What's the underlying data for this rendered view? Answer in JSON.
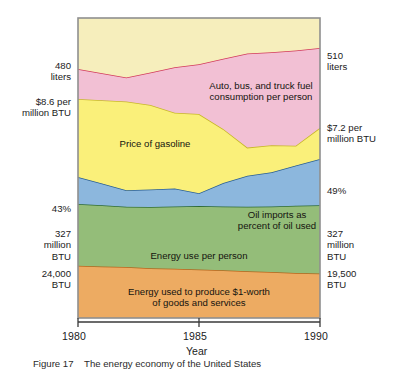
{
  "figure": {
    "caption": "Figure 17    The energy economy of the United States"
  },
  "chart_data": {
    "type": "area",
    "title": "",
    "xlabel": "Year",
    "ylabel": "",
    "xlim": [
      1980,
      1990
    ],
    "ylim": [
      0,
      100
    ],
    "grid": false,
    "legend_position": "inside-bands",
    "x_ticks": [
      "1980",
      "1985",
      "1990"
    ],
    "x": [
      1980,
      1981,
      1982,
      1983,
      1984,
      1985,
      1986,
      1987,
      1988,
      1989,
      1990
    ],
    "stacked_from_bottom": true,
    "series": [
      {
        "name": "Energy used to produce $1-worth of goods and services",
        "label": "Energy used to produce $1-worth\nof goods and services",
        "color": "#edab62",
        "line_color": "#b4651c",
        "units": "BTU",
        "start_value": "24,000 BTU",
        "end_value": "19,500 BTU",
        "band_top_percent": [
          17.4,
          17.2,
          17.0,
          16.6,
          16.4,
          16.2,
          15.9,
          15.6,
          15.3,
          15.0,
          14.8
        ]
      },
      {
        "name": "Energy use per person",
        "label": "Energy use per person",
        "color": "#94bd79",
        "line_color": "#2f6b33",
        "units": "million BTU",
        "start_value": "327 million BTU",
        "end_value": "327 million BTU",
        "band_top_percent": [
          38.0,
          37.6,
          37.1,
          37.0,
          37.2,
          37.3,
          37.2,
          37.1,
          37.2,
          37.4,
          37.6
        ]
      },
      {
        "name": "Oil imports as percent of oil used",
        "label": "Oil imports as\npercent of oil used",
        "color": "#8cb7dd",
        "line_color": "#2a5f93",
        "units": "percent",
        "start_value": "43%",
        "end_value": "49%",
        "band_top_percent": [
          47.0,
          44.8,
          42.6,
          42.8,
          43.2,
          41.6,
          45.0,
          47.4,
          48.6,
          50.8,
          53.0
        ]
      },
      {
        "name": "Price of gasoline",
        "label": "Price of gasoline",
        "color": "#faf07a",
        "line_color": "#c8b82a",
        "units": "per million BTU",
        "start_value": "$8.6 per million BTU",
        "end_value": "$7.2 per million BTU",
        "band_top_percent": [
          73.0,
          72.6,
          72.2,
          71.0,
          68.4,
          68.0,
          63.0,
          56.8,
          57.6,
          57.4,
          63.4
        ]
      },
      {
        "name": "Auto, bus, and truck fuel consumption per person",
        "label": "Auto, bus, and truck fuel\nconsumption per person",
        "color": "#f2c0d4",
        "line_color": "#d23a5c",
        "units": "liters",
        "start_value": "480 liters",
        "end_value": "510 liters",
        "band_top_percent": [
          83.0,
          81.6,
          80.2,
          81.8,
          83.6,
          84.6,
          86.4,
          88.2,
          88.6,
          89.2,
          90.0
        ]
      },
      {
        "name": "Upper background area",
        "label": "",
        "color": "#f6eebc",
        "line_color": "#b9b9b9",
        "units": "",
        "start_value": "",
        "end_value": "",
        "band_top_percent": [
          100,
          100,
          100,
          100,
          100,
          100,
          100,
          100,
          100,
          100,
          100
        ]
      }
    ],
    "left_annotations": [
      {
        "text": "480\nliters",
        "series": "Auto, bus, and truck fuel consumption per person"
      },
      {
        "text": "$8.6 per\nmillion BTU",
        "series": "Price of gasoline"
      },
      {
        "text": "43%",
        "series": "Oil imports as percent of oil used"
      },
      {
        "text": "327\nmillion\nBTU",
        "series": "Energy use per person"
      },
      {
        "text": "24,000\nBTU",
        "series": "Energy used to produce $1-worth of goods and services"
      }
    ],
    "right_annotations": [
      {
        "text": "510\nliters",
        "series": "Auto, bus, and truck fuel consumption per person"
      },
      {
        "text": "$7.2 per\nmillion BTU",
        "series": "Price of gasoline"
      },
      {
        "text": "49%",
        "series": "Oil imports as percent of oil used"
      },
      {
        "text": "327\nmillion\nBTU",
        "series": "Energy use per person"
      },
      {
        "text": "19,500\nBTU",
        "series": "Energy used to produce $1-worth of goods and services"
      }
    ]
  },
  "colors": {
    "plot_border": "#8f8f8f",
    "axis_line": "#3a3a3a",
    "text": "#1b1b1b",
    "background": "#ffffff"
  }
}
